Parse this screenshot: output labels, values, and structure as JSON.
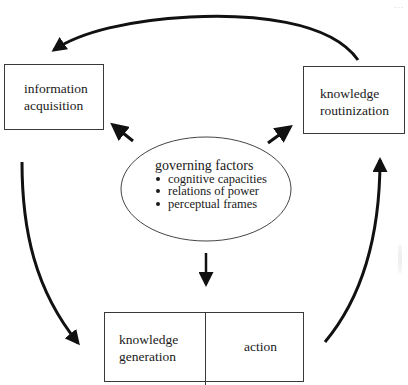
{
  "diagram": {
    "type": "cycle-diagram",
    "page_mark": "...",
    "nodes": {
      "information_acquisition": {
        "line1": "information",
        "line2": "acquisition"
      },
      "knowledge_routinization": {
        "line1": "knowledge",
        "line2": "routinization"
      },
      "governing_factors": {
        "title": "governing factors",
        "items": [
          "cognitive capacities",
          "relations of power",
          "perceptual frames"
        ]
      },
      "knowledge_generation": {
        "line1": "knowledge",
        "line2": "generation"
      },
      "action": {
        "label": "action"
      }
    },
    "edges": [
      {
        "from": "knowledge routinization",
        "to": "information acquisition",
        "style": "curved-arrow"
      },
      {
        "from": "information acquisition",
        "to": "knowledge generation",
        "style": "curved-arrow"
      },
      {
        "from": "action",
        "to": "knowledge routinization",
        "style": "curved-arrow"
      },
      {
        "from": "governing factors",
        "to": "information acquisition",
        "style": "straight-arrow"
      },
      {
        "from": "governing factors",
        "to": "knowledge routinization",
        "style": "straight-arrow"
      },
      {
        "from": "governing factors",
        "to": "knowledge generation / action",
        "style": "straight-arrow"
      },
      {
        "from": "knowledge generation",
        "to": "action",
        "style": "double-arrow"
      }
    ],
    "colors": {
      "line": "#111111",
      "box_border": "#3a3a3a",
      "background": "#ffffff"
    }
  }
}
